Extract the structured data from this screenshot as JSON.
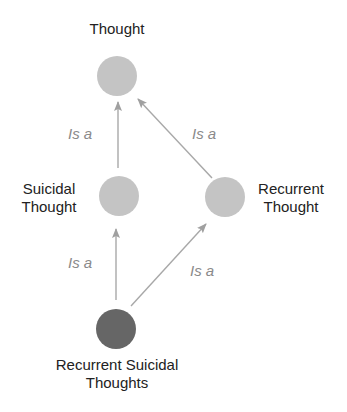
{
  "diagram": {
    "nodes": [
      {
        "id": "thought",
        "label_lines": [
          "Thought"
        ],
        "cx": 117,
        "cy": 76,
        "r": 20,
        "fill": "#c4c4c4"
      },
      {
        "id": "suicidal_thought",
        "label_lines": [
          "Suicidal",
          "Thought"
        ],
        "cx": 119,
        "cy": 196,
        "r": 20,
        "fill": "#c4c4c4"
      },
      {
        "id": "recurrent_thought",
        "label_lines": [
          "Recurrent",
          "Thought"
        ],
        "cx": 225,
        "cy": 197,
        "r": 20,
        "fill": "#c4c4c4"
      },
      {
        "id": "recurrent_suicidal_thoughts",
        "label_lines": [
          "Recurrent Suicidal",
          "Thoughts"
        ],
        "cx": 116,
        "cy": 329,
        "r": 20,
        "fill": "#666666"
      }
    ],
    "edges": [
      {
        "from": "suicidal_thought",
        "to": "thought",
        "label": "Is a"
      },
      {
        "from": "recurrent_thought",
        "to": "thought",
        "label": "Is a"
      },
      {
        "from": "recurrent_suicidal_thoughts",
        "to": "suicidal_thought",
        "label": "Is a"
      },
      {
        "from": "recurrent_suicidal_thoughts",
        "to": "recurrent_thought",
        "label": "Is a"
      }
    ],
    "labels": {
      "thought": "Thought",
      "suicidal_1": "Suicidal",
      "suicidal_2": "Thought",
      "recurrent_1": "Recurrent",
      "recurrent_2": "Thought",
      "rst_1": "Recurrent Suicidal",
      "rst_2": "Thoughts",
      "edge_1": "Is a",
      "edge_2": "Is a",
      "edge_3": "Is a",
      "edge_4": "Is a"
    },
    "colors": {
      "node_light": "#c4c4c4",
      "node_dark": "#666666",
      "edge": "#a8a8a8",
      "edge_label": "#8a8a8a",
      "node_label": "#222222"
    }
  }
}
